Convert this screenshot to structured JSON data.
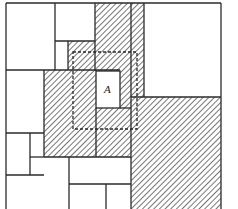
{
  "diagram": {
    "type": "rectangle-partition",
    "label_A": "A",
    "colors": {
      "stroke": "#2a2a2a",
      "hatch": "#555555",
      "background": "#ffffff"
    }
  }
}
